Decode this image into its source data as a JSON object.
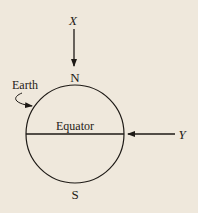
{
  "diagram": {
    "labels": {
      "x": "X",
      "n": "N",
      "s": "S",
      "earth": "Earth",
      "equator": "Equator",
      "y": "Y"
    },
    "colors": {
      "background": "#efe8dc",
      "ink": "#1e1a16"
    }
  }
}
